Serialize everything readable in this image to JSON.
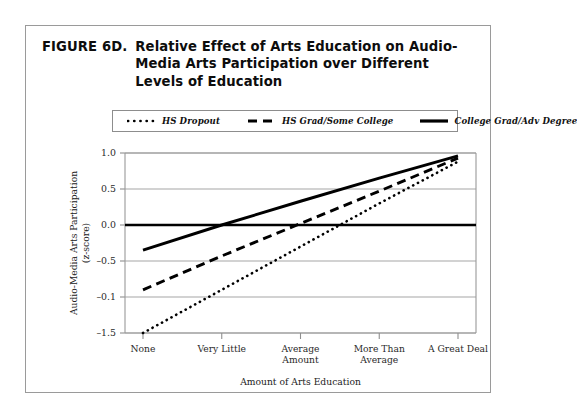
{
  "figure": {
    "label": "FIGURE 6D.",
    "title": "Relative Effect of Arts Education on Audio-Media Arts Participation over Different Levels of Education"
  },
  "chart_data": {
    "type": "line",
    "title": "Relative Effect of Arts Education on Audio-Media Arts Participation over Different Levels of Education",
    "xlabel": "Amount of Arts Education",
    "ylabel": "Audio-Media Arts Participation (z-score)",
    "categories": [
      "None",
      "Very Little",
      "Average Amount",
      "More Than Average",
      "A Great Deal"
    ],
    "ytick_labels": [
      "1.0",
      "0.5",
      "0.0",
      "-0.5",
      "-0.1",
      "-1.5"
    ],
    "ytick_values": [
      1.0,
      0.5,
      0.0,
      -0.5,
      -1.0,
      -1.5
    ],
    "ylim": [
      -1.5,
      1.0
    ],
    "grid": true,
    "legend_position": "top",
    "zero_reference_line": 0.0,
    "series": [
      {
        "name": "HS Dropout",
        "style": "dotted",
        "color": "#000000",
        "values": [
          -1.5,
          -0.9,
          -0.3,
          0.3,
          0.88
        ]
      },
      {
        "name": "HS Grad/Some College",
        "style": "dashed",
        "color": "#000000",
        "values": [
          -0.9,
          -0.43,
          0.02,
          0.47,
          0.93
        ]
      },
      {
        "name": "College Grad/Adv Degree",
        "style": "solid",
        "color": "#000000",
        "values": [
          -0.35,
          0.0,
          0.33,
          0.65,
          0.96
        ]
      }
    ]
  },
  "legend": {
    "items": [
      {
        "label": "HS Dropout",
        "style": "dotted"
      },
      {
        "label": "HS Grad/Some College",
        "style": "dashed"
      },
      {
        "label": "College Grad/Adv Degree",
        "style": "solid"
      }
    ]
  },
  "axes": {
    "y_title_line1": "Audio-Media Arts Participation",
    "y_title_line2": "(z-score)",
    "x_title": "Amount of Arts Education",
    "x_labels": [
      {
        "line1": "None",
        "line2": ""
      },
      {
        "line1": "Very Little",
        "line2": ""
      },
      {
        "line1": "Average",
        "line2": "Amount"
      },
      {
        "line1": "More Than",
        "line2": "Average"
      },
      {
        "line1": "A Great Deal",
        "line2": ""
      }
    ],
    "y_labels": [
      "1.0",
      "0.5",
      "0.0",
      "-0.5",
      "-0.1",
      "-1.5"
    ]
  },
  "colors": {
    "ink": "#000000",
    "frame": "#9a9a9a",
    "grid": "#a5a5a5"
  }
}
